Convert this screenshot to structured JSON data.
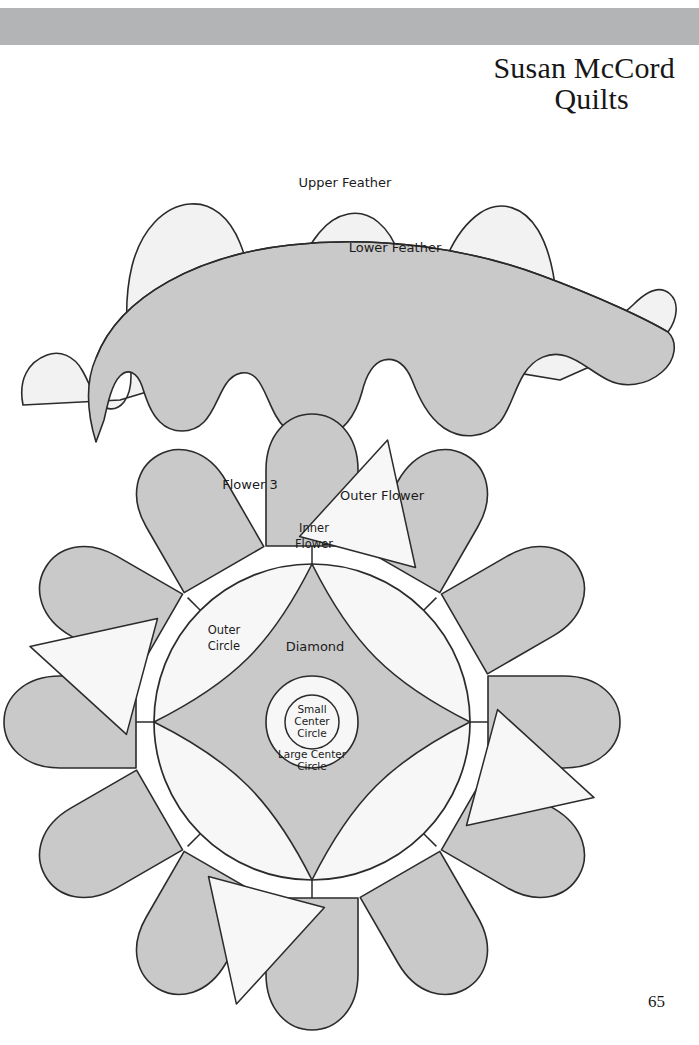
{
  "page": {
    "number": "65",
    "background_color": "#ffffff",
    "banner_color": "#b2b4b6"
  },
  "header": {
    "title_line1": "Susan McCord",
    "title_line2": "Quilts"
  },
  "colors": {
    "light_fill": "#f2f2f2",
    "mid_fill": "#c9c9c9",
    "pale_fill": "#f7f7f7",
    "stroke": "#2b2b2b",
    "text": "#1b1b1b"
  },
  "feather_template": {
    "name": "Feather template",
    "labels": {
      "upper": "Upper Feather",
      "lower": "Lower Feather"
    }
  },
  "flower_template": {
    "name": "Flower template",
    "labels": {
      "flower3": "Flower 3",
      "outer_flower": "Outer Flower",
      "inner_flower_line1": "Inner",
      "inner_flower_line2": "Flower",
      "outer_circle_line1": "Outer",
      "outer_circle_line2": "Circle",
      "diamond": "Diamond",
      "small_center_line1": "Small",
      "small_center_line2": "Center",
      "small_center_line3": "Circle",
      "large_center_line1": "Large Center",
      "large_center_line2": "Circle"
    },
    "petal_count": 12
  }
}
